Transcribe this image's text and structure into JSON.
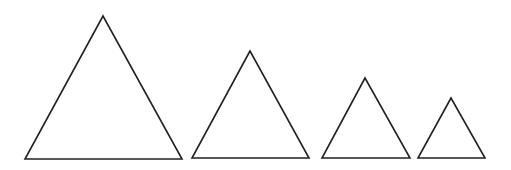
{
  "diagram": {
    "stroke_color": "#222222",
    "background": "#ffffff",
    "triangles": [
      {
        "name": "triangle-1",
        "points": "103,16 25,159 182,159"
      },
      {
        "name": "triangle-2",
        "points": "250,51 192,158 309,158"
      },
      {
        "name": "triangle-3",
        "points": "365,78 322,158 410,158"
      },
      {
        "name": "triangle-4",
        "points": "451,98 418,158 485,158"
      }
    ]
  }
}
